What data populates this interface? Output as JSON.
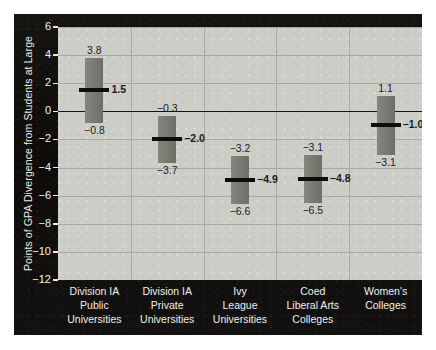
{
  "chart_data": {
    "type": "bar",
    "title": "",
    "xlabel": "",
    "ylabel": "Points of GPA Divergence from Students at Large",
    "ylim": [
      -12,
      6
    ],
    "yticks": [
      6,
      4,
      2,
      0,
      -2,
      -4,
      -6,
      -8,
      -10,
      -12
    ],
    "ytick_labels": [
      "6",
      "4",
      "2",
      "0",
      "−2",
      "−4",
      "−6",
      "−8",
      "−10",
      "−12"
    ],
    "grid": true,
    "legend": null,
    "zero_reference_line": 0,
    "categories": [
      "Division IA Public Universities",
      "Division IA Private Universities",
      "Ivy League Universities",
      "Coed Liberal Arts Colleges",
      "Women's Colleges"
    ],
    "category_label_lines": [
      [
        "Division IA",
        "Public",
        "Universities"
      ],
      [
        "Division IA",
        "Private",
        "Universities"
      ],
      [
        "Ivy",
        "League",
        "Universities"
      ],
      [
        "Coed",
        "Liberal Arts",
        "Colleges"
      ],
      [
        "Women's",
        "Colleges"
      ]
    ],
    "series": [
      {
        "name": "High",
        "values": [
          3.8,
          -0.3,
          -3.2,
          -3.1,
          1.1
        ]
      },
      {
        "name": "Median",
        "values": [
          1.5,
          -2.0,
          -4.9,
          -4.8,
          -1.0
        ]
      },
      {
        "name": "Low",
        "values": [
          -0.8,
          -3.7,
          -6.6,
          -6.5,
          -3.1
        ]
      }
    ],
    "bars": [
      {
        "category": "Division IA Public Universities",
        "high": 3.8,
        "median": 1.5,
        "low": -0.8,
        "high_label": "3.8",
        "median_label": "1.5",
        "low_label": "−0.8"
      },
      {
        "category": "Division IA Private Universities",
        "high": -0.3,
        "median": -2.0,
        "low": -3.7,
        "high_label": "−0.3",
        "median_label": "−2.0",
        "low_label": "−3.7"
      },
      {
        "category": "Ivy League Universities",
        "high": -3.2,
        "median": -4.9,
        "low": -6.6,
        "high_label": "−3.2",
        "median_label": "−4.9",
        "low_label": "−6.6"
      },
      {
        "category": "Coed Liberal Arts Colleges",
        "high": -3.1,
        "median": -4.8,
        "low": -6.5,
        "high_label": "−3.1",
        "median_label": "−4.8",
        "low_label": "−6.5"
      },
      {
        "category": "Women's Colleges",
        "high": 1.1,
        "median": -1.0,
        "low": -3.1,
        "high_label": "1.1",
        "median_label": "−1.0",
        "low_label": "−3.1"
      }
    ],
    "colors": {
      "panel_background": "#100f0d",
      "plot_background": "#cdcdc8",
      "bar_fill": "#77776f",
      "median_line": "#0d0d0d",
      "gridline": "#a9a9a4",
      "zero_line": "#141414",
      "axis_text": "#f2f2ef",
      "value_text": "#1a1a1a"
    }
  }
}
